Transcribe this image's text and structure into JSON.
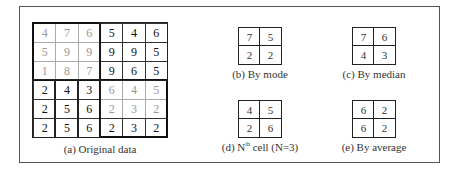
{
  "original": {
    "caption": "(a) Original data",
    "rows": [
      [
        4,
        7,
        6,
        5,
        4,
        6
      ],
      [
        5,
        9,
        9,
        9,
        9,
        5
      ],
      [
        1,
        8,
        7,
        9,
        6,
        5
      ],
      [
        2,
        4,
        3,
        6,
        4,
        5
      ],
      [
        2,
        5,
        6,
        2,
        3,
        2
      ],
      [
        2,
        5,
        6,
        2,
        3,
        2
      ]
    ],
    "r0": [
      "4",
      "7",
      "6",
      "5",
      "4",
      "6"
    ],
    "r1": [
      "5",
      "9",
      "9",
      "9",
      "9",
      "5"
    ],
    "r2": [
      "1",
      "8",
      "7",
      "9",
      "6",
      "5"
    ],
    "r3": [
      "2",
      "4",
      "3",
      "6",
      "4",
      "5"
    ],
    "r4": [
      "2",
      "5",
      "6",
      "2",
      "3",
      "2"
    ],
    "r5": [
      "2",
      "5",
      "6",
      "2",
      "3",
      "2"
    ]
  },
  "mode": {
    "caption": "(b) By mode",
    "cells": [
      "7",
      "5",
      "2",
      "2"
    ]
  },
  "median": {
    "caption": "(c) By median",
    "cells": [
      "7",
      "6",
      "4",
      "3"
    ]
  },
  "nth": {
    "caption_prefix": "(d) N",
    "caption_sup": "th",
    "caption_suffix": " cell (N=3)",
    "cells": [
      "4",
      "5",
      "2",
      "6"
    ]
  },
  "average": {
    "caption": "(e) By average",
    "cells": [
      "6",
      "2",
      "6",
      "2"
    ]
  }
}
